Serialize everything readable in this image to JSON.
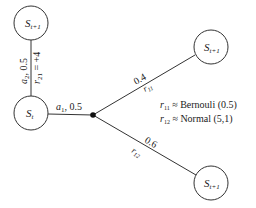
{
  "nodes": {
    "top": {
      "label": "S",
      "sub": "t+1"
    },
    "current": {
      "label": "S",
      "sub": "t"
    },
    "upper_right": {
      "label": "S",
      "sub": "t+1"
    },
    "lower_right": {
      "label": "S",
      "sub": "t+1"
    }
  },
  "edges": {
    "action2": {
      "action": "a",
      "action_sub": "2",
      "prob": ", 0.5",
      "reward": "r",
      "reward_sub": "21",
      "reward_value": " = +4"
    },
    "action1": {
      "action": "a",
      "action_sub": "1",
      "prob": ", 0.5"
    },
    "branch_up": {
      "prob": "0.4",
      "reward": "r",
      "reward_sub": "11"
    },
    "branch_down": {
      "prob": "0.6",
      "reward": "r",
      "reward_sub": "12"
    }
  },
  "legend": {
    "line1": {
      "r": "r",
      "sub": "11",
      "text": " ≈ Bernouli (0.5)"
    },
    "line2": {
      "r": "r",
      "sub": "12",
      "text": " ≈ Normal (5,1)"
    }
  },
  "colors": {
    "stroke": "#333333",
    "text": "#222222"
  }
}
